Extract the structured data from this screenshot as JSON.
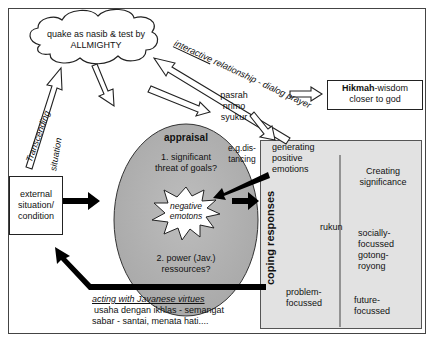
{
  "diagram": {
    "cloud": {
      "line1": "quake as nasib & test by",
      "line2": "ALLMIGHTY"
    },
    "interactive_label": {
      "underlined": "interactive",
      "rest": " relationship - dialog prayer"
    },
    "hikmah_box": {
      "bold": "Hikmah",
      "rest": "-wisdom",
      "line2": "closer to god"
    },
    "attitudes": [
      "pasrah",
      "nrimo",
      "syukur"
    ],
    "distancing": {
      "line1": "e.g.dis-",
      "line2": "tancing"
    },
    "transcending": {
      "line1": "Transcending",
      "line2": "situation"
    },
    "external_box": {
      "line1": "external",
      "line2": "situation/",
      "line3": "condition"
    },
    "appraisal": {
      "title": "appraisal",
      "q1_line1": "1. significant",
      "q1_line2": "threat of goals?",
      "burst_line1": "negative",
      "burst_line2": "emotons",
      "q2_line1": "2. power (Jav.)",
      "q2_line2": "ressources?"
    },
    "coping": {
      "title": "coping responses",
      "generating": [
        "generating",
        "positive",
        "emotions"
      ],
      "creating": [
        "Creating",
        "significance"
      ],
      "rukun": "rukun",
      "socially": [
        "socially-",
        "focussed",
        "gotong-",
        "royong"
      ],
      "problem": [
        "problem-",
        "focussed"
      ],
      "future": [
        "future-",
        "focussed"
      ]
    },
    "virtues": {
      "title": "acting with Javanese virtues",
      "line1": "usaha dengan ikhlas - semangat",
      "line2": "sabar - santai, menata hati...."
    }
  }
}
